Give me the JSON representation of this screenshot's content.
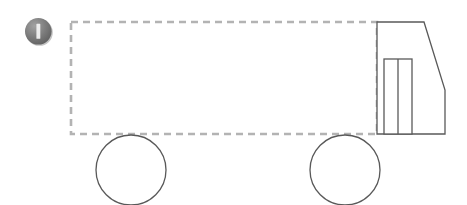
{
  "canvas": {
    "width": 467,
    "height": 205,
    "background": "#ffffff",
    "title": "Truck side-view outline diagram"
  },
  "palette": {
    "dashed_stroke": "#b3b3b3",
    "solid_stroke": "#595959",
    "icon_fill_dark": "#6e6e6e",
    "icon_fill_mid": "#8a8a8a",
    "icon_fill_light": "#9e9e9e",
    "icon_bar": "#e8e8e8",
    "icon_shadow": "#b8b8b8",
    "shape_fill": "#ffffff"
  },
  "icons": {
    "status": {
      "name": "info-circle-icon",
      "glyph": "I",
      "cx": 38.5,
      "cy": 31.5,
      "r": 14.5,
      "bar_width": 4,
      "bar_height": 15
    }
  },
  "shapes": {
    "cargo_box": {
      "label": "cargo-box-dashed",
      "x": 71,
      "y": 22,
      "width": 306,
      "height": 112,
      "stroke": "#b3b3b3",
      "stroke_width": 2.6,
      "dash": "7 5",
      "fill": "none"
    },
    "cab": {
      "label": "cab-body",
      "points": "377,22 424,22 445,90 445,134 377,134",
      "stroke": "#595959",
      "stroke_width": 1.3,
      "fill": "#ffffff"
    },
    "cab_window": {
      "label": "cab-window",
      "x": 384,
      "y": 59,
      "width": 28,
      "height": 75,
      "stroke": "#595959",
      "stroke_width": 1.3,
      "fill": "#ffffff"
    },
    "cab_window_divider": {
      "label": "cab-window-divider",
      "x1": 398,
      "y1": 59,
      "x2": 398,
      "y2": 134,
      "stroke": "#595959",
      "stroke_width": 1.3
    },
    "wheels": [
      {
        "label": "rear-wheel",
        "cx": 131,
        "cy": 170,
        "r": 35,
        "stroke": "#595959",
        "stroke_width": 1.3,
        "fill": "#ffffff"
      },
      {
        "label": "front-wheel",
        "cx": 345,
        "cy": 170,
        "r": 35,
        "stroke": "#595959",
        "stroke_width": 1.3,
        "fill": "#ffffff"
      }
    ]
  },
  "chart_data": {
    "type": "diagram",
    "elements": [
      {
        "name": "status-icon",
        "kind": "circle-glyph",
        "glyph": "I",
        "center": [
          38.5,
          31.5
        ],
        "radius": 14.5
      },
      {
        "name": "cargo-box",
        "kind": "dashed-rectangle",
        "bbox": [
          71,
          22,
          377,
          134
        ]
      },
      {
        "name": "cab-body",
        "kind": "polygon",
        "vertices": [
          [
            377,
            22
          ],
          [
            424,
            22
          ],
          [
            445,
            90
          ],
          [
            445,
            134
          ],
          [
            377,
            134
          ]
        ]
      },
      {
        "name": "cab-window",
        "kind": "rectangle",
        "bbox": [
          384,
          59,
          412,
          134
        ]
      },
      {
        "name": "cab-window-divider",
        "kind": "line",
        "from": [
          398,
          59
        ],
        "to": [
          398,
          134
        ]
      },
      {
        "name": "rear-wheel",
        "kind": "circle",
        "center": [
          131,
          170
        ],
        "radius": 35
      },
      {
        "name": "front-wheel",
        "kind": "circle",
        "center": [
          345,
          170
        ],
        "radius": 35
      }
    ]
  }
}
